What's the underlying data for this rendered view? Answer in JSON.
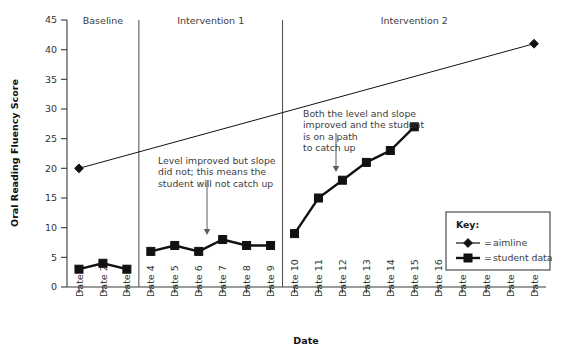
{
  "chart_data": {
    "type": "line",
    "title": "",
    "xlabel": "Date",
    "ylabel": "Oral Reading Fluency Score",
    "ylim": [
      0,
      45
    ],
    "ytick_labels": [
      "0",
      "5",
      "10",
      "15",
      "20",
      "25",
      "30",
      "35",
      "40",
      "45"
    ],
    "ytick_values": [
      0,
      5,
      10,
      15,
      20,
      25,
      30,
      35,
      40,
      45
    ],
    "grid": false,
    "legend_position": "inside-lower-right",
    "categories": [
      "Date 1",
      "Date 2",
      "Date 3",
      "Date 4",
      "Date 5",
      "Date 6",
      "Date 7",
      "Date 8",
      "Date 9",
      "Date 10",
      "Date 11",
      "Date 12",
      "Date 13",
      "Date 14",
      "Date 15",
      "Date 16",
      "Date 17",
      "Date 18",
      "Date 19",
      "Date 20"
    ],
    "series": [
      {
        "name": "aimline",
        "marker": "diamond",
        "x": [
          "Date 1",
          "Date 20"
        ],
        "values": [
          20,
          41
        ]
      },
      {
        "name": "student data",
        "marker": "square",
        "segments": [
          {
            "phase": "Baseline",
            "x": [
              "Date 1",
              "Date 2",
              "Date 3"
            ],
            "values": [
              3,
              4,
              3
            ]
          },
          {
            "phase": "Intervention 1",
            "x": [
              "Date 4",
              "Date 5",
              "Date 6",
              "Date 7",
              "Date 8",
              "Date 9"
            ],
            "values": [
              6,
              7,
              6,
              8,
              7,
              7
            ]
          },
          {
            "phase": "Intervention 2",
            "x": [
              "Date 10",
              "Date 11",
              "Date 12",
              "Date 13",
              "Date 14",
              "Date 15"
            ],
            "values": [
              9,
              15,
              18,
              21,
              23,
              27
            ]
          }
        ]
      }
    ],
    "phases": [
      {
        "label": "Baseline",
        "start": "Date 1",
        "end": "Date 3"
      },
      {
        "label": "Intervention 1",
        "start": "Date 4",
        "end": "Date 9"
      },
      {
        "label": "Intervention 2",
        "start": "Date 10",
        "end": "Date 20"
      }
    ],
    "annotations": [
      {
        "id": "annotation-intervention-1",
        "lines": [
          "Level improved but slope",
          "did not; this means the",
          "student will not catch up"
        ],
        "points_to": {
          "x": "Date 6",
          "y": 6
        }
      },
      {
        "id": "annotation-intervention-2",
        "lines": [
          "Both the level and slope",
          "improved and the student",
          "is on a path",
          "to catch up"
        ],
        "points_to": {
          "x": "Date 12",
          "y": 18
        }
      }
    ],
    "legend": {
      "title": "Key:",
      "entries": [
        {
          "marker": "diamond",
          "separator": "=",
          "label": "aimline"
        },
        {
          "marker": "square",
          "separator": "=",
          "label": "student data"
        }
      ]
    },
    "colors": {
      "ink": "#111111",
      "axis": "#3a3a3a",
      "annotation": "#3c3c3c",
      "background": "#ffffff"
    }
  }
}
